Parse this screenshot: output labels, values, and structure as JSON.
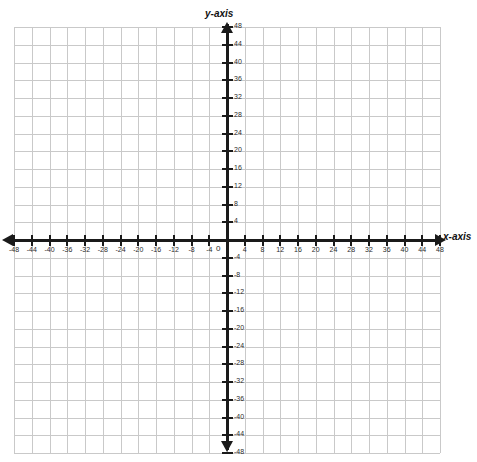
{
  "chart_data": {
    "type": "grid",
    "title": "",
    "xlabel": "x-axis",
    "ylabel": "y-axis",
    "xlim": [
      -48,
      48
    ],
    "ylim": [
      -48,
      48
    ],
    "grid": true,
    "minor_step": 4,
    "cells_per_side": 24,
    "legend": "none",
    "series": [],
    "x_ticks": [
      -48,
      -44,
      -40,
      -36,
      -32,
      -28,
      -24,
      -20,
      -16,
      -12,
      -8,
      -4,
      4,
      8,
      12,
      16,
      20,
      24,
      28,
      32,
      36,
      40,
      44,
      48
    ],
    "y_ticks": [
      48,
      44,
      40,
      36,
      32,
      28,
      24,
      20,
      16,
      12,
      8,
      4,
      -4,
      -8,
      -12,
      -16,
      -20,
      -24,
      -28,
      -32,
      -36,
      -40,
      -44,
      -48
    ],
    "x_tick_labels": [
      "-48",
      "-44",
      "-40",
      "-36",
      "-32",
      "-28",
      "-24",
      "-20",
      "-16",
      "-12",
      "-8",
      "-4",
      "4",
      "8",
      "12",
      "16",
      "20",
      "24",
      "28",
      "32",
      "36",
      "40",
      "44",
      "48"
    ],
    "y_tick_labels": [
      "48",
      "44",
      "40",
      "36",
      "32",
      "28",
      "24",
      "20",
      "16",
      "12",
      "8",
      "4",
      "-4",
      "-8",
      "-12",
      "-16",
      "-20",
      "-24",
      "-28",
      "-32",
      "-36",
      "-40",
      "-44",
      "-48"
    ],
    "origin_label": "0"
  },
  "axes": {
    "x_title": "x-axis",
    "y_title": "y-axis",
    "origin": "0",
    "arrow_left": "arrow-left-icon",
    "arrow_right": "arrow-right-icon",
    "arrow_up": "arrow-up-icon",
    "arrow_down": "arrow-down-icon"
  },
  "colors": {
    "grid_line": "#c9c9c9",
    "axis": "#1a1a1a",
    "label_text": "#2b2b2b",
    "background": "#ffffff"
  }
}
